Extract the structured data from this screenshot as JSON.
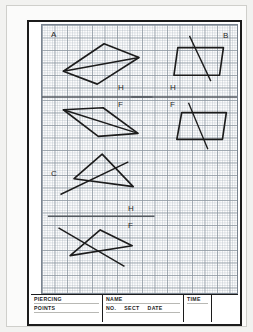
{
  "sheet": {
    "kind": "engineering-drawing-worksheet",
    "paper": "grid-paper"
  },
  "problems": [
    {
      "id": "A",
      "label": "A",
      "position": "top-left",
      "upper_view": "parallelogram-with-diagonal",
      "lower_view": "parallelogram-with-diagonal"
    },
    {
      "id": "B",
      "label": "B",
      "position": "top-right",
      "upper_view": "parallelogram-with-line",
      "lower_view": "parallelogram-with-line"
    },
    {
      "id": "C",
      "label": "C",
      "position": "bottom-left",
      "upper_view": "triangle-with-line",
      "lower_view": "triangle-with-line"
    }
  ],
  "reference_lines": [
    {
      "name": "ref-line-left-top",
      "above_label": "H",
      "below_label": "F"
    },
    {
      "name": "ref-line-right-top",
      "above_label": "H",
      "below_label": "F"
    },
    {
      "name": "ref-line-left-bottom",
      "above_label": "H",
      "below_label": "F"
    }
  ],
  "labels": {
    "h": "H",
    "f": "F",
    "a": "A",
    "b": "B",
    "c": "C"
  },
  "title_block": {
    "piercing_line1": "PIERCING",
    "piercing_line2": "POINTS",
    "name": "NAME",
    "no": "NO.",
    "sect": "SECT",
    "date": "DATE",
    "time": "TIME"
  },
  "colors": {
    "ink": "#1c1c1c",
    "grid_minor": "#aab4be",
    "grid_major": "#8c96a0",
    "paper": "#fdfdfd",
    "ref_line": "#555a60"
  }
}
